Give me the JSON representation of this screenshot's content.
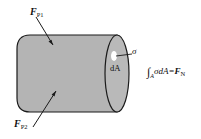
{
  "diagram": {
    "labels": {
      "force_p1": {
        "symbol": "F",
        "sub": "P1"
      },
      "force_p2": {
        "symbol": "F",
        "sub": "P2"
      },
      "stress": "σ",
      "area_element": "dA",
      "equation": {
        "integral": "∫",
        "lower": "A",
        "integrand": "σdA=",
        "result_symbol": "F",
        "result_sub": "N"
      }
    },
    "colors": {
      "body_fill": "#b4b4b4",
      "outline": "#1a1a1a",
      "area_highlight": "#ffffff"
    }
  }
}
